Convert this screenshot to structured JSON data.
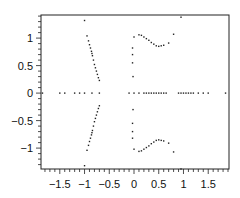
{
  "chart_data": {
    "type": "scatter",
    "title": "",
    "xlabel": "",
    "ylabel": "",
    "xlim": [
      -1.88,
      1.92
    ],
    "ylim": [
      -1.38,
      1.42
    ],
    "grid": false,
    "legend": null,
    "x_ticks": [
      -1.5,
      -1,
      -0.5,
      0,
      0.5,
      1,
      1.5
    ],
    "x_tick_labels": [
      "−1.5",
      "−1",
      "−0.5",
      "0",
      "0.5",
      "1",
      "1.5"
    ],
    "y_ticks": [
      1,
      0.5,
      0,
      -0.5,
      -1
    ],
    "y_tick_labels": [
      "1",
      "0.5",
      "0",
      "−0.5",
      "−1"
    ],
    "series": [
      {
        "name": "real-axis points",
        "points": [
          [
            -1.85,
            0
          ],
          [
            -1.5,
            0
          ],
          [
            -1.4,
            0
          ],
          [
            -1.2,
            0
          ],
          [
            -1.1,
            0
          ],
          [
            -1.0,
            0
          ],
          [
            -0.85,
            0
          ],
          [
            -0.7,
            0
          ],
          [
            -0.1,
            0
          ],
          [
            0.0,
            0
          ],
          [
            0.1,
            0
          ],
          [
            0.2,
            0
          ],
          [
            0.25,
            0
          ],
          [
            0.3,
            0
          ],
          [
            0.35,
            0
          ],
          [
            0.4,
            0
          ],
          [
            0.45,
            0
          ],
          [
            0.5,
            0
          ],
          [
            0.55,
            0
          ],
          [
            0.6,
            0
          ],
          [
            0.65,
            0
          ],
          [
            0.9,
            0
          ],
          [
            0.95,
            0
          ],
          [
            1.0,
            0
          ],
          [
            1.05,
            0
          ],
          [
            1.1,
            0
          ],
          [
            1.15,
            0
          ],
          [
            1.2,
            0
          ],
          [
            1.3,
            0
          ],
          [
            1.4,
            0
          ],
          [
            1.5,
            0
          ],
          [
            1.85,
            0
          ]
        ]
      },
      {
        "name": "left upper branch",
        "points": [
          [
            -1.0,
            1.32
          ],
          [
            -0.95,
            1.04
          ],
          [
            -0.92,
            0.95
          ],
          [
            -0.9,
            0.88
          ],
          [
            -0.88,
            0.82
          ],
          [
            -0.86,
            0.76
          ],
          [
            -0.85,
            0.72
          ],
          [
            -0.84,
            0.68
          ],
          [
            -0.82,
            0.6
          ],
          [
            -0.8,
            0.52
          ],
          [
            -0.78,
            0.46
          ],
          [
            -0.76,
            0.4
          ],
          [
            -0.74,
            0.34
          ],
          [
            -0.72,
            0.28
          ],
          [
            -0.7,
            0.23
          ]
        ]
      },
      {
        "name": "left lower branch",
        "points": [
          [
            -1.0,
            -1.32
          ],
          [
            -0.95,
            -1.04
          ],
          [
            -0.92,
            -0.95
          ],
          [
            -0.9,
            -0.88
          ],
          [
            -0.88,
            -0.82
          ],
          [
            -0.86,
            -0.76
          ],
          [
            -0.85,
            -0.72
          ],
          [
            -0.84,
            -0.68
          ],
          [
            -0.82,
            -0.6
          ],
          [
            -0.8,
            -0.52
          ],
          [
            -0.78,
            -0.46
          ],
          [
            -0.76,
            -0.4
          ],
          [
            -0.74,
            -0.34
          ],
          [
            -0.72,
            -0.28
          ],
          [
            -0.7,
            -0.23
          ]
        ]
      },
      {
        "name": "right upper branch",
        "points": [
          [
            -0.02,
            0.3
          ],
          [
            -0.03,
            0.55
          ],
          [
            -0.03,
            0.7
          ],
          [
            -0.03,
            0.82
          ],
          [
            0.0,
            1.02
          ],
          [
            0.1,
            1.06
          ],
          [
            0.15,
            1.05
          ],
          [
            0.2,
            1.02
          ],
          [
            0.25,
            0.99
          ],
          [
            0.3,
            0.96
          ],
          [
            0.35,
            0.92
          ],
          [
            0.4,
            0.89
          ],
          [
            0.45,
            0.86
          ],
          [
            0.5,
            0.85
          ],
          [
            0.55,
            0.86
          ],
          [
            0.6,
            0.87
          ],
          [
            0.7,
            0.91
          ],
          [
            0.8,
            1.07
          ],
          [
            0.95,
            1.38
          ]
        ]
      },
      {
        "name": "right lower branch",
        "points": [
          [
            -0.02,
            -0.3
          ],
          [
            -0.03,
            -0.55
          ],
          [
            -0.03,
            -0.7
          ],
          [
            -0.03,
            -0.82
          ],
          [
            0.0,
            -1.02
          ],
          [
            0.1,
            -1.06
          ],
          [
            0.15,
            -1.05
          ],
          [
            0.2,
            -1.02
          ],
          [
            0.25,
            -0.99
          ],
          [
            0.3,
            -0.96
          ],
          [
            0.35,
            -0.92
          ],
          [
            0.4,
            -0.89
          ],
          [
            0.45,
            -0.86
          ],
          [
            0.5,
            -0.85
          ],
          [
            0.55,
            -0.86
          ],
          [
            0.6,
            -0.87
          ],
          [
            0.7,
            -0.91
          ],
          [
            0.8,
            -1.07
          ],
          [
            0.95,
            -1.38
          ]
        ]
      }
    ]
  }
}
